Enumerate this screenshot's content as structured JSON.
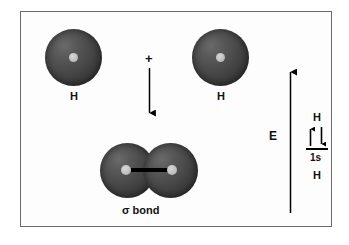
{
  "figure": {
    "background_color": "#fdfdfd",
    "frame_color": "#6b6b6b",
    "sphere_color": "#3b3b3b",
    "nucleus_color": "#c0c0c0",
    "ink_color": "#111111"
  },
  "reactants": {
    "left_atom": {
      "label": "H",
      "orbital": "1s"
    },
    "right_atom": {
      "label": "H",
      "orbital": "1s"
    },
    "combine_symbol": "+"
  },
  "reaction_arrow": {
    "direction": "down",
    "label": ""
  },
  "product": {
    "label": "σ bond",
    "left_atom_label": "H",
    "right_atom_label": "H",
    "bond_type": "sigma"
  },
  "energy_diagram": {
    "axis_label": "E",
    "axis_direction": "up",
    "orbital_label": "1s",
    "top_atom_label": "H",
    "bottom_atom_label": "H",
    "electrons": [
      {
        "spin": "up",
        "glyph": "↑"
      },
      {
        "spin": "down",
        "glyph": "↓"
      }
    ],
    "electron_count": 2
  }
}
